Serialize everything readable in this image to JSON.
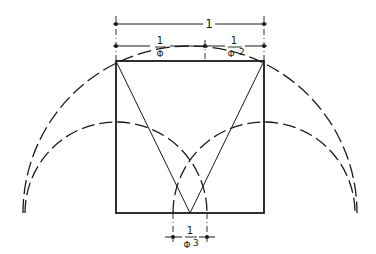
{
  "diagram": {
    "dimensions": {
      "total": {
        "num": "1"
      },
      "left_segment": {
        "num": "1",
        "den": "Φ"
      },
      "right_segment": {
        "num": "1",
        "den": "Φ",
        "exp": "2"
      },
      "bottom_segment": {
        "num": "1",
        "den": "Φ",
        "exp": "3"
      }
    },
    "colors": {
      "stroke": "#1a1a1a",
      "background": "#ffffff"
    }
  }
}
